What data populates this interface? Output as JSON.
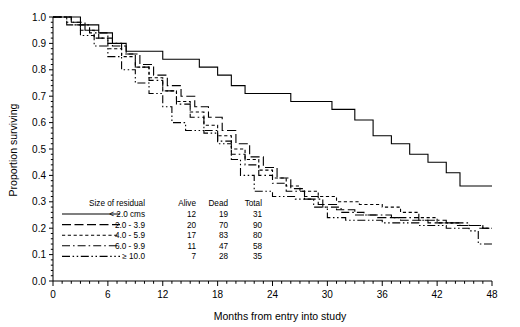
{
  "chart_data": {
    "type": "line",
    "title": "",
    "xlabel": "Months from entry into study",
    "ylabel": "Proportion surviving",
    "xlim": [
      0,
      48
    ],
    "ylim": [
      0,
      1.0
    ],
    "xticks": [
      0,
      6,
      12,
      18,
      24,
      30,
      36,
      42,
      48
    ],
    "xticklabels": [
      "0",
      "6",
      "12",
      "18",
      "24",
      "30",
      "36",
      "42",
      "48"
    ],
    "yticks": [
      0.0,
      0.1,
      0.2,
      0.3,
      0.4,
      0.5,
      0.6,
      0.7,
      0.8,
      0.9,
      1.0
    ],
    "yticklabels": [
      "0.0",
      "0.1",
      "0.2",
      "0.3",
      "0.4",
      "0.5",
      "0.6",
      "0.7",
      "0.8",
      "0.9",
      "1.0"
    ],
    "grid": false,
    "minor_ticks": true,
    "legend_position": "lower-left-inside",
    "step_type": "post",
    "series": [
      {
        "name": "< 2.0 cms",
        "linestyle": "solid",
        "alive": 12,
        "dead": 19,
        "total": 31,
        "points": [
          [
            0,
            1.0
          ],
          [
            3.0,
            0.97
          ],
          [
            5.0,
            0.94
          ],
          [
            6.5,
            0.9
          ],
          [
            8.0,
            0.87
          ],
          [
            12.0,
            0.84
          ],
          [
            16.0,
            0.81
          ],
          [
            18.0,
            0.78
          ],
          [
            19.5,
            0.74
          ],
          [
            21.0,
            0.71
          ],
          [
            26.0,
            0.68
          ],
          [
            30.5,
            0.65
          ],
          [
            33.0,
            0.61
          ],
          [
            35.0,
            0.55
          ],
          [
            37.0,
            0.52
          ],
          [
            39.0,
            0.48
          ],
          [
            41.0,
            0.45
          ],
          [
            43.0,
            0.41
          ],
          [
            44.5,
            0.36
          ],
          [
            48.0,
            0.36
          ]
        ]
      },
      {
        "name": "2.0 - 3.9",
        "linestyle": "long-dash",
        "alive": 20,
        "dead": 70,
        "total": 90,
        "points": [
          [
            0,
            1.0
          ],
          [
            2.0,
            0.98
          ],
          [
            3.5,
            0.95
          ],
          [
            5.0,
            0.92
          ],
          [
            6.5,
            0.89
          ],
          [
            8.0,
            0.86
          ],
          [
            9.5,
            0.82
          ],
          [
            11.0,
            0.78
          ],
          [
            12.5,
            0.74
          ],
          [
            14.0,
            0.7
          ],
          [
            15.5,
            0.66
          ],
          [
            17.0,
            0.62
          ],
          [
            18.5,
            0.57
          ],
          [
            20.0,
            0.52
          ],
          [
            21.5,
            0.47
          ],
          [
            23.0,
            0.43
          ],
          [
            24.5,
            0.39
          ],
          [
            26.0,
            0.35
          ],
          [
            27.5,
            0.32
          ],
          [
            29.0,
            0.29
          ],
          [
            31.0,
            0.27
          ],
          [
            33.0,
            0.25
          ],
          [
            35.5,
            0.24
          ],
          [
            38.0,
            0.23
          ],
          [
            41.0,
            0.22
          ],
          [
            44.0,
            0.21
          ],
          [
            46.5,
            0.2
          ],
          [
            48.0,
            0.2
          ]
        ]
      },
      {
        "name": "4.0 - 5.9",
        "linestyle": "short-dash",
        "alive": 17,
        "dead": 83,
        "total": 80,
        "points": [
          [
            0,
            1.0
          ],
          [
            1.5,
            0.98
          ],
          [
            3.0,
            0.95
          ],
          [
            4.5,
            0.92
          ],
          [
            6.0,
            0.88
          ],
          [
            7.5,
            0.85
          ],
          [
            9.0,
            0.81
          ],
          [
            10.5,
            0.77
          ],
          [
            12.0,
            0.72
          ],
          [
            13.5,
            0.68
          ],
          [
            15.0,
            0.64
          ],
          [
            16.5,
            0.59
          ],
          [
            18.0,
            0.55
          ],
          [
            19.5,
            0.5
          ],
          [
            21.0,
            0.46
          ],
          [
            22.5,
            0.42
          ],
          [
            24.0,
            0.39
          ],
          [
            25.5,
            0.36
          ],
          [
            27.0,
            0.34
          ],
          [
            29.0,
            0.32
          ],
          [
            31.0,
            0.3
          ],
          [
            33.5,
            0.29
          ],
          [
            36.0,
            0.28
          ],
          [
            38.0,
            0.26
          ],
          [
            40.0,
            0.24
          ],
          [
            42.0,
            0.22
          ],
          [
            44.5,
            0.21
          ],
          [
            47.0,
            0.2
          ],
          [
            48.0,
            0.2
          ]
        ]
      },
      {
        "name": "6.0 - 9.9",
        "linestyle": "dash-dot",
        "alive": 11,
        "dead": 47,
        "total": 58,
        "points": [
          [
            0,
            1.0
          ],
          [
            2.0,
            0.97
          ],
          [
            4.0,
            0.94
          ],
          [
            6.0,
            0.9
          ],
          [
            7.5,
            0.86
          ],
          [
            9.0,
            0.81
          ],
          [
            10.5,
            0.76
          ],
          [
            12.0,
            0.72
          ],
          [
            13.5,
            0.67
          ],
          [
            15.0,
            0.62
          ],
          [
            16.5,
            0.57
          ],
          [
            18.0,
            0.53
          ],
          [
            19.5,
            0.48
          ],
          [
            21.0,
            0.44
          ],
          [
            22.5,
            0.4
          ],
          [
            24.0,
            0.37
          ],
          [
            25.5,
            0.34
          ],
          [
            27.5,
            0.31
          ],
          [
            29.5,
            0.28
          ],
          [
            31.5,
            0.26
          ],
          [
            34.0,
            0.25
          ],
          [
            37.0,
            0.24
          ],
          [
            40.0,
            0.23
          ],
          [
            43.0,
            0.22
          ],
          [
            45.5,
            0.21
          ],
          [
            47.0,
            0.2
          ],
          [
            48.0,
            0.2
          ]
        ]
      },
      {
        "name": "≥ 10.0",
        "linestyle": "dash-dot-dot",
        "alive": 7,
        "dead": 28,
        "total": 35,
        "points": [
          [
            0,
            1.0
          ],
          [
            1.5,
            0.97
          ],
          [
            3.0,
            0.93
          ],
          [
            4.5,
            0.89
          ],
          [
            6.0,
            0.85
          ],
          [
            7.5,
            0.8
          ],
          [
            9.0,
            0.75
          ],
          [
            10.5,
            0.71
          ],
          [
            12.0,
            0.66
          ],
          [
            13.0,
            0.6
          ],
          [
            14.5,
            0.57
          ],
          [
            16.5,
            0.56
          ],
          [
            18.0,
            0.52
          ],
          [
            19.5,
            0.46
          ],
          [
            20.5,
            0.4
          ],
          [
            22.0,
            0.34
          ],
          [
            24.0,
            0.32
          ],
          [
            26.5,
            0.31
          ],
          [
            28.5,
            0.28
          ],
          [
            30.0,
            0.24
          ],
          [
            32.0,
            0.23
          ],
          [
            36.0,
            0.22
          ],
          [
            40.0,
            0.21
          ],
          [
            43.0,
            0.2
          ],
          [
            45.5,
            0.19
          ],
          [
            46.5,
            0.14
          ],
          [
            48.0,
            0.14
          ]
        ]
      }
    ]
  },
  "legend": {
    "headers": {
      "series": "Size of residual",
      "alive": "Alive",
      "dead": "Dead",
      "total": "Total"
    },
    "rows": [
      {
        "label": "< 2.0 cms",
        "alive": "12",
        "dead": "19",
        "total": "31",
        "style": "solid"
      },
      {
        "label": "2.0 - 3.9",
        "alive": "20",
        "dead": "70",
        "total": "90",
        "style": "long-dash"
      },
      {
        "label": "4.0 - 5.9",
        "alive": "17",
        "dead": "83",
        "total": "80",
        "style": "short-dash"
      },
      {
        "label": "6.0 - 9.9",
        "alive": "11",
        "dead": "47",
        "total": "58",
        "style": "dash-dot"
      },
      {
        "label": "≥ 10.0",
        "alive": "7",
        "dead": "28",
        "total": "35",
        "style": "dash-dot-dot"
      }
    ]
  },
  "colors": {
    "ink": "#000000",
    "background": "#ffffff"
  }
}
